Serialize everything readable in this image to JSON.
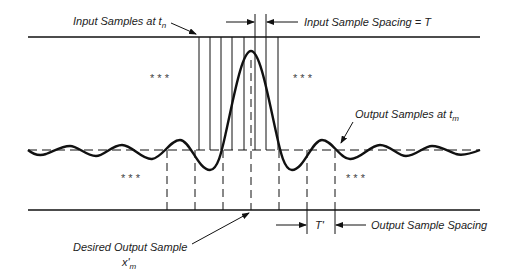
{
  "labels": {
    "input_samples": "Input Samples at t",
    "input_samples_sub": "n",
    "input_spacing": "Input Sample Spacing = T",
    "output_samples": "Output Samples at t",
    "output_samples_sub": "m",
    "desired_output": "Desired Output Sample",
    "desired_output_symbol": "x'",
    "desired_output_sub": "m",
    "t_prime": "T'",
    "output_spacing": "Output Sample Spacing",
    "ellipsis": "* * *"
  },
  "colors": {
    "line": "#111111",
    "background": "#ffffff"
  },
  "geometry": {
    "top_line_y": 37,
    "baseline_y": 150,
    "bottom_line_y": 210,
    "input_sample_x": [
      199,
      210,
      221,
      232,
      244,
      255,
      266,
      278
    ],
    "output_sample_x": [
      167,
      195,
      223,
      251,
      279,
      307,
      335
    ],
    "peak": {
      "x": 251,
      "y": 51
    }
  }
}
